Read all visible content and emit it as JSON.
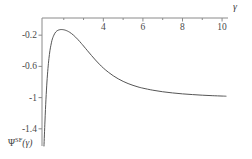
{
  "chart_data": {
    "type": "line",
    "title": "",
    "subtitle": "",
    "xlabel": "γ",
    "ylabel": "Ψ",
    "ylabel_superscript": "SF",
    "ylabel_argument": "(γ)",
    "xlim": [
      0.9,
      10.3
    ],
    "ylim": [
      -1.62,
      0.02
    ],
    "grid": false,
    "legend": null,
    "axis_position": {
      "x_axis_at_y": 0,
      "y_axis_at_x": 1
    },
    "xticks": [
      4,
      6,
      8,
      10
    ],
    "xtick_labels": [
      "4",
      "6",
      "8",
      "10"
    ],
    "xminor_ticks": [
      2,
      3,
      5,
      7,
      9
    ],
    "yticks": [
      -0.2,
      -0.6,
      -1,
      -1.4
    ],
    "ytick_labels": [
      "-0.2",
      "-0.6",
      "-1",
      "-1.4"
    ],
    "line_color": "#555555",
    "axis_color": "#8a8a8a",
    "series": [
      {
        "name": "Ψ^SF(γ)",
        "x": [
          1.0,
          1.05,
          1.1,
          1.15,
          1.2,
          1.25,
          1.3,
          1.35,
          1.4,
          1.45,
          1.5,
          1.55,
          1.6,
          1.65,
          1.7,
          1.75,
          1.8,
          1.85,
          1.9,
          1.95,
          2.0,
          2.05,
          2.1,
          2.15,
          2.2,
          2.3,
          2.4,
          2.5,
          2.6,
          2.7,
          2.8,
          2.9,
          3.0,
          3.2,
          3.4,
          3.6,
          3.8,
          4.0,
          4.25,
          4.5,
          4.75,
          5.0,
          5.25,
          5.5,
          5.75,
          6.0,
          6.5,
          7.0,
          7.5,
          8.0,
          8.5,
          9.0,
          9.5,
          10.0,
          10.2
        ],
        "y": [
          -1.62,
          -1.3,
          -1.02,
          -0.8,
          -0.63,
          -0.5,
          -0.4,
          -0.33,
          -0.27,
          -0.23,
          -0.2,
          -0.175,
          -0.158,
          -0.146,
          -0.138,
          -0.133,
          -0.13,
          -0.128,
          -0.128,
          -0.129,
          -0.131,
          -0.134,
          -0.138,
          -0.143,
          -0.149,
          -0.163,
          -0.181,
          -0.202,
          -0.226,
          -0.252,
          -0.28,
          -0.309,
          -0.339,
          -0.4,
          -0.46,
          -0.518,
          -0.572,
          -0.621,
          -0.674,
          -0.72,
          -0.759,
          -0.792,
          -0.82,
          -0.843,
          -0.863,
          -0.879,
          -0.905,
          -0.925,
          -0.94,
          -0.952,
          -0.961,
          -0.969,
          -0.975,
          -0.98,
          -0.982
        ]
      }
    ],
    "asymptote": -1,
    "peak": {
      "x": 1.87,
      "y": -0.128
    }
  }
}
